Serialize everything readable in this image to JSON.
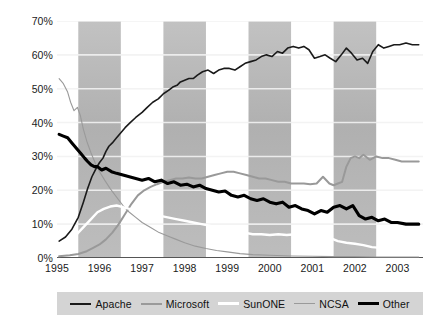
{
  "chart_data": {
    "type": "line",
    "title": "",
    "xlabel": "",
    "ylabel": "",
    "xlim": [
      1995.0,
      2003.6
    ],
    "ylim": [
      0,
      70
    ],
    "grid": true,
    "y_tick_labels": [
      "70%",
      "60%",
      "50%",
      "40%",
      "30%",
      "20%",
      "10%",
      "0%"
    ],
    "y_ticks": [
      70,
      60,
      50,
      40,
      30,
      20,
      10,
      0
    ],
    "x_tick_labels": [
      "1995",
      "1996",
      "1997",
      "1998",
      "1999",
      "2000",
      "2001",
      "2002",
      "2003"
    ],
    "x_ticks": [
      1995,
      1996,
      1997,
      1998,
      1999,
      2000,
      2001,
      2002,
      2003
    ],
    "legend_position": "bottom",
    "background_bands": [
      [
        1995.5,
        1996.5
      ],
      [
        1997.5,
        1998.5
      ],
      [
        1999.5,
        2000.5
      ],
      [
        2001.5,
        2002.5
      ]
    ],
    "band_color": "#b4b4b4",
    "series": [
      {
        "name": "Apache",
        "color": "#1a1a1a",
        "width": 1.6,
        "x": [
          1995.05,
          1995.2,
          1995.35,
          1995.5,
          1995.62,
          1995.72,
          1995.82,
          1995.92,
          1996.0,
          1996.08,
          1996.15,
          1996.22,
          1996.3,
          1996.4,
          1996.5,
          1996.6,
          1996.72,
          1996.85,
          1997.0,
          1997.12,
          1997.25,
          1997.38,
          1997.5,
          1997.62,
          1997.72,
          1997.82,
          1997.9,
          1998.0,
          1998.1,
          1998.2,
          1998.3,
          1998.42,
          1998.55,
          1998.68,
          1998.8,
          1998.92,
          1999.05,
          1999.18,
          1999.3,
          1999.42,
          1999.55,
          1999.68,
          1999.8,
          1999.92,
          2000.05,
          2000.18,
          2000.3,
          2000.42,
          2000.55,
          2000.68,
          2000.8,
          2000.92,
          2001.05,
          2001.18,
          2001.3,
          2001.42,
          2001.55,
          2001.68,
          2001.8,
          2001.92,
          2002.05,
          2002.18,
          2002.3,
          2002.42,
          2002.55,
          2002.68,
          2002.8,
          2002.92,
          2003.05,
          2003.2,
          2003.35,
          2003.5
        ],
        "y": [
          5.0,
          6.2,
          8.5,
          12.0,
          16.5,
          20.5,
          24.0,
          26.5,
          28.2,
          29.5,
          31.5,
          33.0,
          34.0,
          35.5,
          37.0,
          38.5,
          40.0,
          41.5,
          43.0,
          44.5,
          46.0,
          47.0,
          48.5,
          49.5,
          50.5,
          51.0,
          52.0,
          52.5,
          53.0,
          53.0,
          54.0,
          55.0,
          55.5,
          54.5,
          55.5,
          56.0,
          56.0,
          55.5,
          56.5,
          57.5,
          58.0,
          58.5,
          59.5,
          60.0,
          59.5,
          61.0,
          60.5,
          62.0,
          62.5,
          62.0,
          62.5,
          61.5,
          59.0,
          59.5,
          60.0,
          59.0,
          58.0,
          60.0,
          62.0,
          60.5,
          58.5,
          59.0,
          57.5,
          61.0,
          63.0,
          62.0,
          62.5,
          63.0,
          63.0,
          63.5,
          63.0,
          63.0
        ]
      },
      {
        "name": "Microsoft",
        "color": "#999999",
        "width": 2.0,
        "x": [
          1995.05,
          1995.3,
          1995.5,
          1995.7,
          1995.85,
          1996.0,
          1996.15,
          1996.3,
          1996.45,
          1996.6,
          1996.75,
          1996.9,
          1997.05,
          1997.2,
          1997.35,
          1997.5,
          1997.65,
          1997.8,
          1997.95,
          1998.1,
          1998.25,
          1998.4,
          1998.55,
          1998.7,
          1998.85,
          1999.0,
          1999.15,
          1999.3,
          1999.45,
          1999.6,
          1999.75,
          1999.9,
          2000.05,
          2000.2,
          2000.35,
          2000.5,
          2000.65,
          2000.8,
          2000.95,
          2001.1,
          2001.25,
          2001.4,
          2001.5,
          2001.6,
          2001.7,
          2001.8,
          2001.9,
          2002.0,
          2002.1,
          2002.2,
          2002.35,
          2002.5,
          2002.65,
          2002.8,
          2002.95,
          2003.1,
          2003.25,
          2003.4,
          2003.5
        ],
        "y": [
          0.5,
          0.8,
          1.2,
          2.0,
          3.0,
          4.0,
          5.5,
          7.5,
          10.0,
          13.0,
          16.0,
          18.5,
          20.0,
          21.0,
          21.8,
          22.5,
          23.0,
          23.5,
          23.5,
          23.8,
          23.5,
          23.5,
          24.0,
          24.5,
          25.0,
          25.5,
          25.5,
          25.0,
          24.5,
          24.0,
          23.5,
          23.5,
          23.0,
          22.5,
          22.5,
          22.0,
          22.0,
          22.0,
          21.8,
          22.0,
          24.0,
          22.0,
          21.5,
          22.0,
          22.5,
          27.0,
          29.5,
          30.0,
          29.5,
          30.5,
          29.0,
          30.0,
          29.5,
          29.5,
          29.0,
          28.5,
          28.5,
          28.5,
          28.5
        ]
      },
      {
        "name": "SunONE",
        "color": "#ffffff",
        "width": 2.4,
        "x": [
          1995.05,
          1995.2,
          1995.35,
          1995.5,
          1995.65,
          1995.8,
          1995.95,
          1996.1,
          1996.25,
          1996.4,
          1996.55,
          1996.7,
          1996.85,
          1997.0,
          1997.2,
          1997.4,
          1997.6,
          1997.8,
          1998.0,
          1998.2,
          1998.4,
          1998.6,
          1998.8,
          1999.0,
          1999.2,
          1999.4,
          1999.6,
          1999.8,
          2000.0,
          2000.2,
          2000.4,
          2000.6,
          2000.8,
          2001.0,
          2001.2,
          2001.4,
          2001.6,
          2001.8,
          2002.0,
          2002.2,
          2002.4,
          2002.6,
          2002.8,
          2003.0,
          2003.2,
          2003.4,
          2003.5
        ],
        "y": [
          2.0,
          3.0,
          5.0,
          7.5,
          9.5,
          11.5,
          13.5,
          14.5,
          15.2,
          15.5,
          15.0,
          14.5,
          14.0,
          13.5,
          13.0,
          12.5,
          12.0,
          11.5,
          11.0,
          10.5,
          10.0,
          9.5,
          9.0,
          8.5,
          8.0,
          7.5,
          7.0,
          7.0,
          6.8,
          7.0,
          6.8,
          7.0,
          7.0,
          6.5,
          6.5,
          6.0,
          5.0,
          4.5,
          4.2,
          3.8,
          3.2,
          3.0,
          2.5,
          2.2,
          2.0,
          2.0,
          2.0
        ]
      },
      {
        "name": "NCSA",
        "color": "#9a9a9a",
        "width": 1.1,
        "x": [
          1995.05,
          1995.15,
          1995.25,
          1995.32,
          1995.4,
          1995.48,
          1995.55,
          1995.62,
          1995.7,
          1995.8,
          1995.9,
          1996.0,
          1996.12,
          1996.25,
          1996.4,
          1996.55,
          1996.7,
          1996.85,
          1997.0,
          1997.2,
          1997.4,
          1997.6,
          1997.8,
          1998.0,
          1998.25,
          1998.5,
          1998.75,
          1999.0,
          1999.3,
          1999.6,
          2000.0,
          2000.5,
          2001.0,
          2001.5,
          2002.0,
          2002.5,
          2003.0,
          2003.5
        ],
        "y": [
          53.0,
          51.5,
          49.0,
          46.0,
          43.5,
          44.5,
          42.0,
          38.0,
          34.5,
          31.0,
          28.0,
          25.5,
          23.0,
          20.5,
          18.0,
          15.5,
          13.5,
          12.0,
          10.5,
          9.0,
          7.5,
          6.5,
          5.5,
          4.5,
          3.5,
          2.8,
          2.2,
          1.8,
          1.3,
          1.0,
          0.8,
          0.6,
          0.5,
          0.4,
          0.4,
          0.3,
          0.3,
          0.3
        ]
      },
      {
        "name": "Other",
        "color": "#000000",
        "width": 3.1,
        "x": [
          1995.05,
          1995.15,
          1995.25,
          1995.35,
          1995.45,
          1995.55,
          1995.65,
          1995.72,
          1995.8,
          1995.88,
          1995.95,
          1996.05,
          1996.15,
          1996.28,
          1996.4,
          1996.55,
          1996.7,
          1996.85,
          1997.0,
          1997.15,
          1997.3,
          1997.45,
          1997.6,
          1997.75,
          1997.9,
          1998.05,
          1998.2,
          1998.35,
          1998.5,
          1998.65,
          1998.8,
          1998.95,
          1999.1,
          1999.25,
          1999.4,
          1999.55,
          1999.7,
          1999.85,
          2000.0,
          2000.15,
          2000.3,
          2000.45,
          2000.6,
          2000.75,
          2000.9,
          2001.05,
          2001.2,
          2001.35,
          2001.5,
          2001.65,
          2001.8,
          2001.95,
          2002.1,
          2002.25,
          2002.4,
          2002.55,
          2002.7,
          2002.85,
          2003.0,
          2003.2,
          2003.4,
          2003.5
        ],
        "y": [
          36.5,
          36.0,
          35.5,
          34.0,
          32.5,
          31.0,
          29.5,
          28.5,
          27.5,
          27.0,
          27.0,
          26.0,
          26.5,
          25.5,
          25.0,
          24.5,
          24.0,
          23.5,
          23.0,
          23.5,
          22.5,
          23.0,
          22.0,
          22.5,
          21.5,
          21.8,
          21.0,
          21.5,
          20.5,
          20.0,
          19.5,
          19.8,
          18.5,
          18.0,
          18.5,
          17.5,
          17.0,
          17.5,
          16.5,
          16.0,
          16.5,
          15.0,
          15.5,
          14.5,
          14.0,
          13.0,
          14.0,
          13.5,
          15.0,
          15.5,
          14.5,
          15.5,
          12.5,
          11.5,
          12.0,
          11.0,
          11.5,
          10.5,
          10.5,
          10.0,
          10.0,
          10.0
        ]
      }
    ]
  },
  "legend": {
    "items": [
      {
        "label": "Apache",
        "color": "#1a1a1a",
        "width": 2
      },
      {
        "label": "Microsoft",
        "color": "#9a9a9a",
        "width": 2
      },
      {
        "label": "SunONE",
        "color": "#ffffff",
        "width": 3
      },
      {
        "label": "NCSA",
        "color": "#9a9a9a",
        "width": 1
      },
      {
        "label": "Other",
        "color": "#000000",
        "width": 3
      }
    ]
  }
}
